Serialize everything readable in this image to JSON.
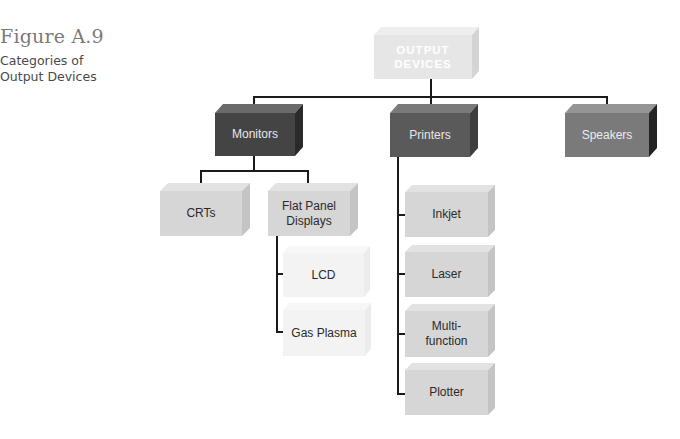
{
  "figure": {
    "number": "Figure A.9",
    "caption": "Categories of Output Devices"
  },
  "diagram": {
    "root": {
      "label_line1": "OUTPUT",
      "label_line2": "DEVICES"
    },
    "level1": [
      {
        "label": "Monitors"
      },
      {
        "label": "Printers"
      },
      {
        "label": "Speakers"
      }
    ],
    "monitors_children": [
      {
        "label": "CRTs"
      },
      {
        "label_line1": "Flat Panel",
        "label_line2": "Displays"
      }
    ],
    "flat_panel_children": [
      {
        "label": "LCD"
      },
      {
        "label": "Gas Plasma"
      }
    ],
    "printers_children": [
      {
        "label": "Inkjet"
      },
      {
        "label": "Laser"
      },
      {
        "label_line1": "Multi-",
        "label_line2": "function"
      },
      {
        "label": "Plotter"
      }
    ]
  },
  "colors": {
    "root_front": "#e6e6e6",
    "root_text": "#ffffff",
    "monitors_front": "#444444",
    "printers_front": "#5a5a5a",
    "speakers_front": "#7a7a7a",
    "light_box_front": "#d6d6d6",
    "faint_box_front": "#f3f3f3",
    "connector": "#1a1a1a"
  }
}
